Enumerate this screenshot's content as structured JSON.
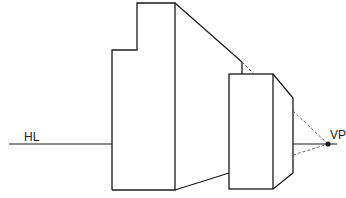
{
  "diagram": {
    "labels": {
      "horizon_line": "HL",
      "vanishing_point": "VP"
    },
    "colors": {
      "stroke": "#1a1a1a",
      "dashed": "#555555",
      "background": "#ffffff"
    },
    "elements": [
      {
        "id": "horizon-line",
        "type": "line",
        "label": "HL"
      },
      {
        "id": "stepped-block-front",
        "type": "polygon"
      },
      {
        "id": "stepped-block-receding-side",
        "type": "polygon"
      },
      {
        "id": "small-block-front",
        "type": "rect"
      },
      {
        "id": "small-block-receding-side",
        "type": "polygon"
      },
      {
        "id": "construction-lines",
        "type": "dashed-lines",
        "converge_to": "VP"
      },
      {
        "id": "vanishing-point",
        "type": "point",
        "label": "VP"
      }
    ]
  }
}
